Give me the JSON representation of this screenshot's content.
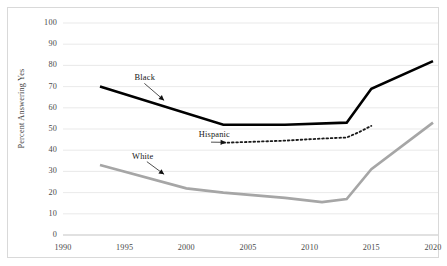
{
  "chart_data": {
    "type": "line",
    "title": "",
    "subtitle": "",
    "xlabel": "",
    "ylabel": "Percent Answering Yes",
    "xlim": [
      1990,
      2020
    ],
    "ylim": [
      0,
      100
    ],
    "grid": "horizontal",
    "legend_position": "inline-annotations",
    "x_ticks": [
      "1990",
      "1995",
      "2000",
      "2005",
      "2010",
      "2015",
      "2020"
    ],
    "y_ticks": [
      "0",
      "10",
      "20",
      "30",
      "40",
      "50",
      "60",
      "70",
      "80",
      "90",
      "100"
    ],
    "series": [
      {
        "name": "Black",
        "color": "#000000",
        "style": "solid",
        "width": 2.6,
        "label_text": "Black",
        "points": [
          {
            "x": 1993,
            "y": 70
          },
          {
            "x": 2003,
            "y": 52
          },
          {
            "x": 2008,
            "y": 52
          },
          {
            "x": 2013,
            "y": 53
          },
          {
            "x": 2015,
            "y": 69
          },
          {
            "x": 2020,
            "y": 82
          }
        ]
      },
      {
        "name": "Hispanic",
        "color": "#1a1a1a",
        "style": "dotted",
        "width": 1.8,
        "label_text": "Hispanic",
        "points": [
          {
            "x": 2003,
            "y": 43.5
          },
          {
            "x": 2008,
            "y": 44.5
          },
          {
            "x": 2011,
            "y": 45.5
          },
          {
            "x": 2013,
            "y": 46
          },
          {
            "x": 2014,
            "y": 48.5
          },
          {
            "x": 2015,
            "y": 51.5
          }
        ]
      },
      {
        "name": "White",
        "color": "#a6a6a6",
        "style": "solid",
        "width": 2.6,
        "label_text": "White",
        "points": [
          {
            "x": 1993,
            "y": 33
          },
          {
            "x": 2000,
            "y": 22
          },
          {
            "x": 2003,
            "y": 20
          },
          {
            "x": 2008,
            "y": 17.5
          },
          {
            "x": 2011,
            "y": 15.5
          },
          {
            "x": 2013,
            "y": 17
          },
          {
            "x": 2015,
            "y": 31
          },
          {
            "x": 2020,
            "y": 53
          }
        ]
      }
    ],
    "annotations": [
      {
        "text": "Black",
        "label_x": 1995.8,
        "label_y": 73.5,
        "arrow_from_x": 1996.6,
        "arrow_from_y": 71.5,
        "arrow_to_x": 1998.2,
        "arrow_to_y": 63.5
      },
      {
        "text": "Hispanic",
        "label_x": 2001.0,
        "label_y": 46.5,
        "arrow_from_x": 2002.0,
        "arrow_from_y": 43.8,
        "arrow_to_x": 2003.2,
        "arrow_to_y": 43.7
      },
      {
        "text": "White",
        "label_x": 1995.6,
        "label_y": 36.5,
        "arrow_from_x": 1996.8,
        "arrow_from_y": 34.6,
        "arrow_to_x": 1998.2,
        "arrow_to_y": 28.6
      }
    ]
  },
  "colors": {
    "background": "#ffffff",
    "frame_border": "#d9d9d9",
    "gridline": "#e3e3e3",
    "tick_text": "#4a4a4a",
    "black_series": "#000000",
    "gray_series": "#a6a6a6",
    "hispanic_series": "#1a1a1a"
  }
}
